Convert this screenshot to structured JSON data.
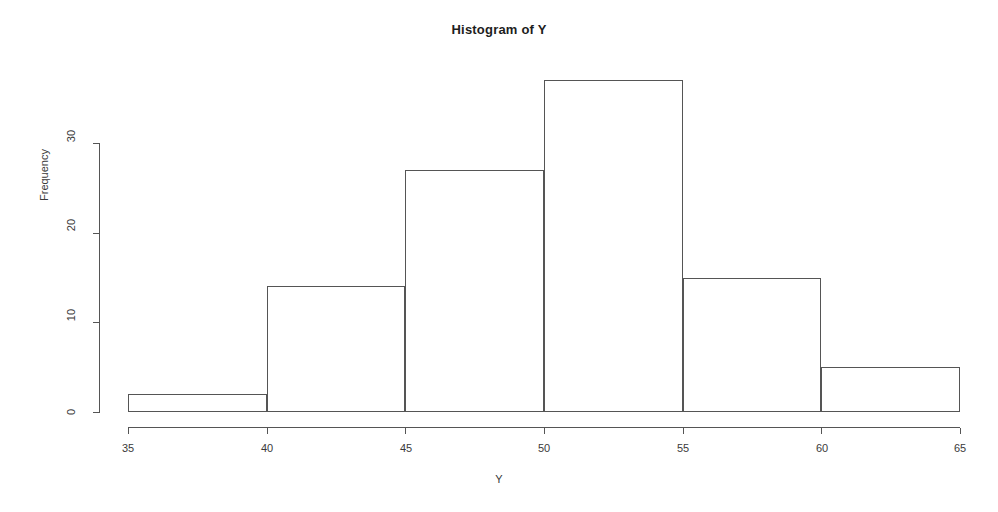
{
  "chart_data": {
    "type": "bar",
    "title": "Histogram of Y",
    "xlabel": "Y",
    "ylabel": "Frequency",
    "grid": false,
    "legend": "none",
    "bin_edges": [
      35,
      40,
      45,
      50,
      55,
      60,
      65
    ],
    "categories": [
      "35-40",
      "40-45",
      "45-50",
      "50-55",
      "55-60",
      "60-65"
    ],
    "values": [
      2,
      14,
      27,
      37,
      15,
      5
    ],
    "xlim": [
      35,
      65
    ],
    "ylim": [
      0,
      37
    ],
    "xticks": [
      35,
      40,
      45,
      50,
      55,
      60,
      65
    ],
    "yticks": [
      0,
      10,
      20,
      30
    ],
    "xtick_labels": [
      "35",
      "40",
      "45",
      "50",
      "55",
      "60",
      "65"
    ],
    "ytick_labels": [
      "0",
      "10",
      "20",
      "30"
    ],
    "bar_fill": "#ffffff",
    "bar_stroke": "#555555",
    "axis_color": "#555555",
    "background": "#ffffff"
  }
}
